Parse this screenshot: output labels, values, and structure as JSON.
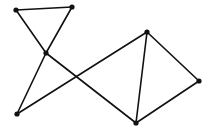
{
  "diagram": {
    "type": "undirected-graph",
    "stroke_color": "#111111",
    "node_color": "#111111",
    "background": "#ffffff",
    "nodes": [
      {
        "id": "A",
        "x": 16,
        "y": 10
      },
      {
        "id": "B",
        "x": 72,
        "y": 7
      },
      {
        "id": "C",
        "x": 46,
        "y": 53
      },
      {
        "id": "D",
        "x": 147,
        "y": 32
      },
      {
        "id": "E",
        "x": 199,
        "y": 81
      },
      {
        "id": "F",
        "x": 17,
        "y": 114
      },
      {
        "id": "G",
        "x": 136,
        "y": 123
      }
    ],
    "edges": [
      [
        "A",
        "B"
      ],
      [
        "A",
        "C"
      ],
      [
        "B",
        "C"
      ],
      [
        "C",
        "F"
      ],
      [
        "C",
        "G"
      ],
      [
        "F",
        "D"
      ],
      [
        "D",
        "G"
      ],
      [
        "D",
        "E"
      ],
      [
        "E",
        "G"
      ]
    ]
  }
}
